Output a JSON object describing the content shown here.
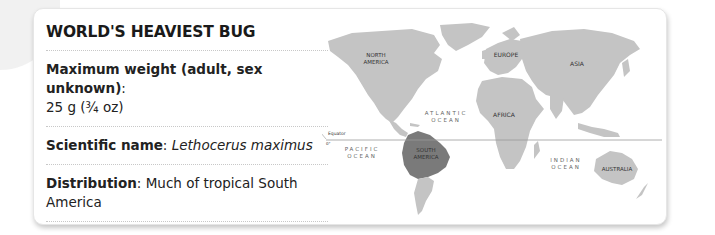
{
  "card": {
    "title": "WORLD'S HEAVIEST BUG",
    "facts": [
      {
        "label": "Maximum weight (adult, sex unknown)",
        "separator": ":",
        "value": "25 g (¾ oz)"
      },
      {
        "label": "Scientific name",
        "separator": ": ",
        "value": "Lethocerus maximus"
      },
      {
        "label": "Distribution",
        "separator": ": ",
        "value": "Much of tropical South America"
      }
    ]
  },
  "map": {
    "highlight_color": "#7a7a7a",
    "land_color": "#c4c4c4",
    "continents": {
      "north_america_1": "NORTH",
      "north_america_2": "AMERICA",
      "europe": "EUROPE",
      "asia": "ASIA",
      "africa": "AFRICA",
      "south_america_1": "SOUTH",
      "south_america_2": "AMERICA",
      "australia": "AUSTRALIA"
    },
    "oceans": {
      "atlantic_1": "ATLANTIC",
      "atlantic_2": "OCEAN",
      "pacific_1": "PACIFIC",
      "pacific_2": "OCEAN",
      "indian_1": "INDIAN",
      "indian_2": "OCEAN"
    },
    "equator_label": "Equator",
    "equator_degree": "0°"
  }
}
